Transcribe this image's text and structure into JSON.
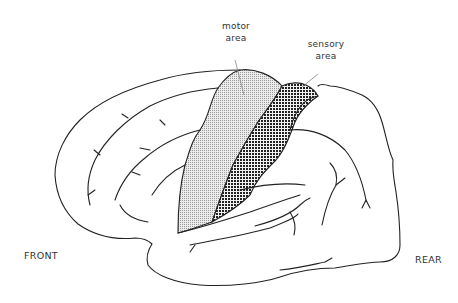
{
  "diagram": {
    "labels": {
      "motor": [
        "motor",
        "area"
      ],
      "sensory": [
        "sensory",
        "area"
      ],
      "front": "FRONT",
      "rear": "REAR"
    },
    "regions": [
      {
        "name": "motor area",
        "pattern": "fine-dot",
        "color": "#d8d8d8"
      },
      {
        "name": "sensory area",
        "pattern": "checker",
        "color": "#555555"
      }
    ],
    "colors": {
      "outline": "#222222",
      "background": "#ffffff",
      "text": "#333333"
    }
  }
}
